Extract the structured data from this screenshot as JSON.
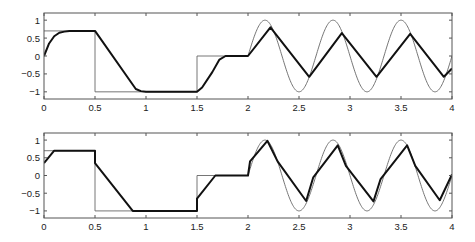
{
  "chart_data": [
    {
      "type": "line",
      "title": "",
      "xlabel": "",
      "ylabel": "",
      "xlim": [
        0,
        4
      ],
      "ylim": [
        -1.2,
        1.2
      ],
      "grid": false,
      "legend": null,
      "xticks": [
        0,
        0.5,
        1,
        1.5,
        2,
        2.5,
        3,
        3.5,
        4
      ],
      "xtick_labels": [
        "0",
        "0.5",
        "1",
        "1.5",
        "2",
        "2.5",
        "3",
        "3.5",
        "4"
      ],
      "yticks": [
        1,
        0.5,
        0,
        -0.5,
        -1
      ],
      "ytick_labels": [
        "1",
        "0.5",
        "0",
        "−0.5",
        "−1"
      ],
      "series": [
        {
          "name": "reference (thin)",
          "style": "thin",
          "description": "0.7 on [0,0.5), -1 on [0.5,1.5), 0 on [1.5,2), sin(2*pi*1.5*(t-2)) on [2,4]",
          "x": [
            0,
            0.5,
            0.5,
            1.5,
            1.5,
            2.0
          ],
          "y": [
            0.7,
            0.7,
            -1,
            -1,
            0,
            0
          ],
          "sine": {
            "start": 2.0,
            "end": 4.0,
            "amplitude": 1.0,
            "frequency": 1.5
          }
        },
        {
          "name": "output (thick)",
          "style": "thick",
          "x": [
            0,
            0.05,
            0.1,
            0.15,
            0.2,
            0.25,
            0.3,
            0.5,
            0.9,
            0.95,
            1.0,
            1.5,
            1.55,
            1.65,
            1.72,
            1.78,
            2.0,
            2.22,
            2.6,
            2.92,
            3.26,
            3.59,
            3.92,
            4.0
          ],
          "y": [
            0,
            0.35,
            0.55,
            0.65,
            0.68,
            0.7,
            0.7,
            0.7,
            -0.92,
            -0.98,
            -1.0,
            -1.0,
            -0.88,
            -0.45,
            -0.1,
            0.0,
            0.0,
            0.8,
            -0.58,
            0.64,
            -0.58,
            0.62,
            -0.58,
            -0.35
          ]
        }
      ]
    },
    {
      "type": "line",
      "title": "",
      "xlabel": "",
      "ylabel": "",
      "xlim": [
        0,
        4
      ],
      "ylim": [
        -1.2,
        1.2
      ],
      "grid": false,
      "legend": null,
      "xticks": [
        0,
        0.5,
        1,
        1.5,
        2,
        2.5,
        3,
        3.5,
        4
      ],
      "xtick_labels": [
        "0",
        "0.5",
        "1",
        "1.5",
        "2",
        "2.5",
        "3",
        "3.5",
        "4"
      ],
      "yticks": [
        1,
        0.5,
        0,
        -0.5,
        -1
      ],
      "ytick_labels": [
        "1",
        "0.5",
        "0",
        "−0.5",
        "−1"
      ],
      "series": [
        {
          "name": "reference (thin)",
          "style": "thin",
          "description": "0.7 on [0,0.5), -1 on [0.5,1.5), 0 on [1.5,2), sin(2*pi*1.5*(t-2)) on [2,4]",
          "x": [
            0,
            0.5,
            0.5,
            1.5,
            1.5,
            2.0
          ],
          "y": [
            0.7,
            0.7,
            -1,
            -1,
            0,
            0
          ],
          "sine": {
            "start": 2.0,
            "end": 4.0,
            "amplitude": 1.0,
            "frequency": 1.5
          }
        },
        {
          "name": "output (thick)",
          "style": "thick",
          "x": [
            0,
            0.1,
            0.5,
            0.5,
            0.87,
            1.5,
            1.5,
            1.68,
            2.0,
            2.02,
            2.19,
            2.29,
            2.57,
            2.64,
            2.88,
            2.96,
            3.23,
            3.3,
            3.56,
            3.64,
            3.88,
            4.0
          ],
          "y": [
            0.35,
            0.7,
            0.7,
            0.35,
            -1.0,
            -1.0,
            -0.65,
            0.0,
            0.0,
            0.4,
            0.98,
            0.4,
            -0.72,
            -0.05,
            0.85,
            0.27,
            -0.73,
            -0.1,
            0.85,
            0.27,
            -0.7,
            0.03
          ]
        }
      ]
    }
  ],
  "layout": {
    "panels": [
      {
        "left": 44,
        "right": 452,
        "top": 13,
        "bottom": 99
      },
      {
        "left": 44,
        "right": 452,
        "top": 133,
        "bottom": 218
      }
    ]
  }
}
